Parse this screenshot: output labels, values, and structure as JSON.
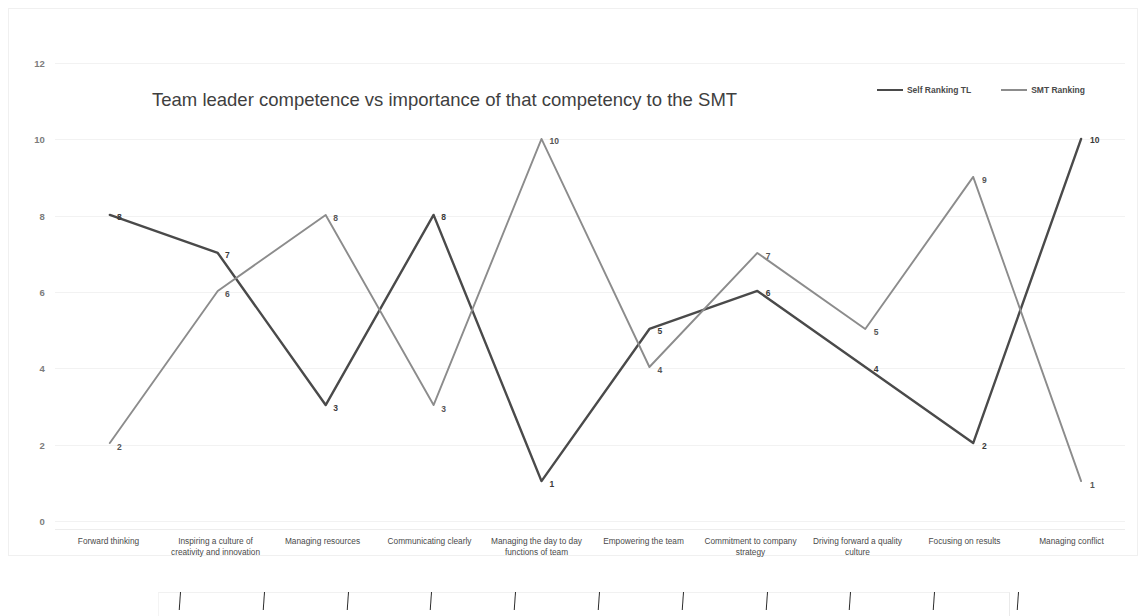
{
  "chart_data": {
    "type": "line",
    "title": "Team leader competence vs importance of that competency to the SMT",
    "xlabel": "",
    "ylabel": "",
    "ylim": [
      0,
      12
    ],
    "yticks": [
      0,
      2,
      4,
      6,
      8,
      10,
      12
    ],
    "grid": true,
    "legend_position": "top-right",
    "categories": [
      "Forward thinking",
      "Inspiring a culture of creativity and innovation",
      "Managing resources",
      "Communicating clearly",
      "Managing the day to day functions of team",
      "Empowering the team",
      "Commitment to company strategy",
      "Driving forward a quality culture",
      "Focusing on  results",
      "Managing conflict"
    ],
    "series": [
      {
        "name": "Self Ranking TL",
        "color": "#4a4a4a",
        "values": [
          8,
          7,
          3,
          8,
          1,
          5,
          6,
          4,
          2,
          10
        ]
      },
      {
        "name": "SMT Ranking",
        "color": "#8c8c8c",
        "values": [
          2,
          6,
          8,
          3,
          10,
          4,
          7,
          5,
          9,
          1
        ]
      }
    ]
  },
  "legend": {
    "items": [
      {
        "label": "Self Ranking TL",
        "color": "#4a4a4a"
      },
      {
        "label": "SMT Ranking",
        "color": "#8c8c8c"
      }
    ]
  },
  "bottom_axis": {
    "tick_count": 11,
    "visible": true
  }
}
